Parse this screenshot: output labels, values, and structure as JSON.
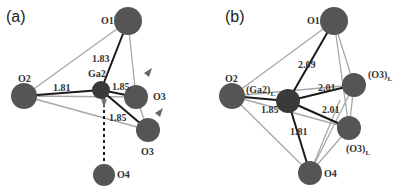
{
  "panels": [
    {
      "label": "(a)",
      "atoms": {
        "O1": {
          "label": "O1",
          "x": 128,
          "y": 21,
          "r": 14
        },
        "O2": {
          "label": "O2",
          "x": 24,
          "y": 96,
          "r": 13
        },
        "Ga2": {
          "label": "Ga2",
          "x": 101,
          "y": 90,
          "r": 9
        },
        "O3a": {
          "label": "O3",
          "x": 136,
          "y": 97,
          "r": 12
        },
        "O3b": {
          "label": "O3",
          "x": 148,
          "y": 130,
          "r": 12
        },
        "O4": {
          "label": "O4",
          "x": 104,
          "y": 175,
          "r": 11
        }
      },
      "bonds": [
        {
          "from": "Ga2",
          "to": "O1",
          "value": "1.83"
        },
        {
          "from": "Ga2",
          "to": "O2",
          "value": "1.81"
        },
        {
          "from": "Ga2",
          "to": "O3a",
          "value": "1.85"
        },
        {
          "from": "Ga2",
          "to": "O3b",
          "value": "1.85"
        },
        {
          "from": "Ga2",
          "to": "O4",
          "value": "",
          "style": "dashed"
        }
      ]
    },
    {
      "label": "(b)",
      "atoms": {
        "O1": {
          "label": "O1",
          "x": 334,
          "y": 21,
          "r": 14
        },
        "O2": {
          "label": "O2",
          "x": 232,
          "y": 96,
          "r": 13
        },
        "Ga2": {
          "label": "(Ga2)",
          "sub": "L",
          "x": 288,
          "y": 101,
          "r": 12
        },
        "O3a": {
          "label": "(O3)",
          "sub": "L",
          "x": 354,
          "y": 85,
          "r": 12
        },
        "O3b": {
          "label": "(O3)",
          "sub": "L",
          "x": 349,
          "y": 128,
          "r": 12
        },
        "O4": {
          "label": "O4",
          "x": 310,
          "y": 173,
          "r": 12
        }
      },
      "bonds": [
        {
          "from": "Ga2",
          "to": "O1",
          "value": "2.09"
        },
        {
          "from": "Ga2",
          "to": "O2",
          "value": "1.85"
        },
        {
          "from": "Ga2",
          "to": "O3a",
          "value": "2.01"
        },
        {
          "from": "Ga2",
          "to": "O3b",
          "value": "2.01"
        },
        {
          "from": "Ga2",
          "to": "O4",
          "value": "1.81"
        }
      ]
    }
  ],
  "colors": {
    "atom": "#555555",
    "ga_atom": "#3a3a3a",
    "bond": "#1a1a1a",
    "edge": "#a8a8a8",
    "arrow": "#666666"
  }
}
